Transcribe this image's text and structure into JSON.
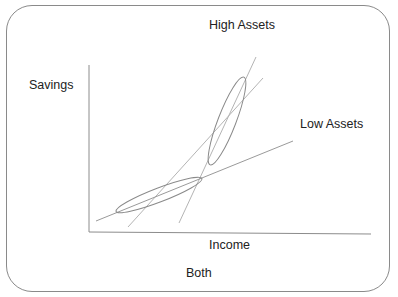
{
  "diagram": {
    "labels": {
      "top": "High Assets",
      "y_axis": "Savings",
      "right": "Low Assets",
      "x_axis": "Income",
      "bottom": "Both"
    },
    "colors": {
      "axis": "#8c8c8c",
      "line": "#b4b4b4",
      "ellipse": "#8a8a8a",
      "frame": "#8a8a8a",
      "text": "#222222"
    },
    "elements": {
      "high_assets_line": {
        "x1": 179,
        "y1": 223,
        "x2": 256,
        "y2": 57
      },
      "both_line": {
        "x1": 128,
        "y1": 227,
        "x2": 263,
        "y2": 78
      },
      "low_assets_line": {
        "x1": 96,
        "y1": 221,
        "x2": 293,
        "y2": 141
      },
      "high_assets_ellipse": {
        "cx": 227,
        "cy": 121,
        "rx": 9,
        "ry": 47,
        "rotate": 21
      },
      "low_assets_ellipse": {
        "cx": 159,
        "cy": 195,
        "rx": 46,
        "ry": 7,
        "rotate": -21
      }
    }
  }
}
